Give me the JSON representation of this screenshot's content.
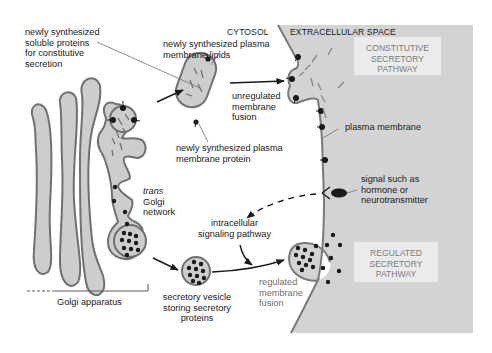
{
  "figure": {
    "type": "diagram",
    "colors": {
      "extracellular_fill": "#d3d3d3",
      "organelle_fill": "#cdcdcd",
      "organelle_outline": "#707070",
      "membrane": "#7a7a7a",
      "cargo_dot": "#1a1a1a",
      "pathway_box_fill": "#ebebeb",
      "pathway_box_text": "#7a7a7a"
    }
  },
  "regions": {
    "cytosol": "CYTOSOL",
    "extracellular": "EXTRACELLULAR SPACE"
  },
  "labels": {
    "soluble_proteins": [
      "newly synthesized",
      "soluble proteins",
      "for constitutive",
      "secretion"
    ],
    "membrane_lipids": [
      "newly synthesized plasma",
      "membrane lipids"
    ],
    "unregulated_fusion": [
      "unregulated",
      "membrane",
      "fusion"
    ],
    "membrane_protein": [
      "newly synthesized plasma",
      "membrane protein"
    ],
    "plasma_membrane": "plasma membrane",
    "signal": [
      "signal such as",
      "hormone or",
      "neurotransmitter"
    ],
    "trans_golgi": {
      "italic": "trans",
      "rest": [
        "Golgi",
        "network"
      ]
    },
    "intracellular_signaling": [
      "intracellular",
      "signaling pathway"
    ],
    "secretory_vesicle": [
      "secretory vesicle",
      "storing secretory",
      "proteins"
    ],
    "regulated_fusion": [
      "regulated",
      "membrane",
      "fusion"
    ],
    "golgi_apparatus": "Golgi apparatus"
  },
  "pathways": {
    "constitutive": [
      "CONSTITUTIVE",
      "SECRETORY",
      "PATHWAY"
    ],
    "regulated": [
      "REGULATED",
      "SECRETORY",
      "PATHWAY"
    ]
  }
}
